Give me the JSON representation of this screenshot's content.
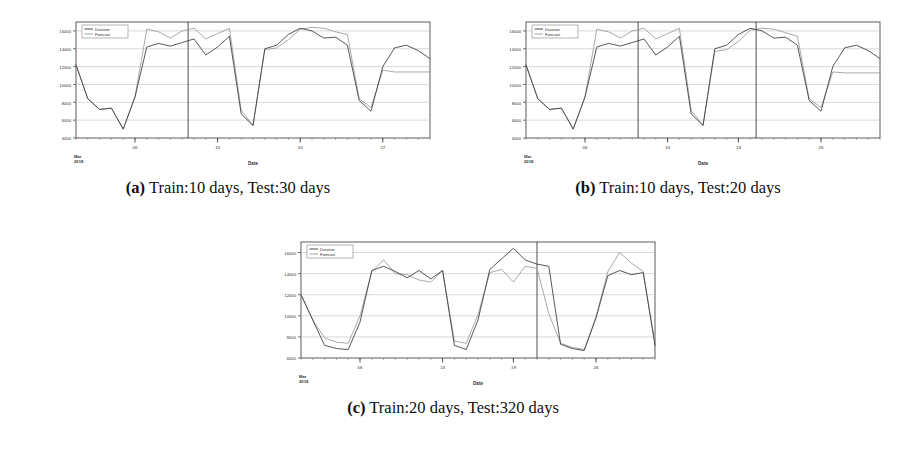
{
  "figure": {
    "panels": [
      {
        "id": "a",
        "letter": "(a)",
        "caption": "Train:10 days, Test:30 days",
        "chart_data": {
          "type": "line",
          "title": "",
          "xlabel": "Date",
          "ylabel": "",
          "origin_label": "Mar\n2018",
          "grid": true,
          "legend_position": "top-left",
          "ylim": [
            4000,
            17000
          ],
          "yticks": [
            4000,
            6000,
            8000,
            10000,
            12000,
            14000,
            16000
          ],
          "ytick_labels": [
            "4000",
            "6000",
            "8000",
            "10000",
            "12000",
            "14000",
            "16000"
          ],
          "xticks": [
            6,
            13,
            20,
            27
          ],
          "xtick_labels": [
            "06",
            "13",
            "20",
            "27"
          ],
          "xlim": [
            1,
            31
          ],
          "split_lines": [
            10.5
          ],
          "series": [
            {
              "name": "Duration",
              "color": "#3a3a3a",
              "x": [
                1,
                2,
                3,
                4,
                5,
                6,
                7,
                8,
                9,
                10,
                11,
                12,
                13,
                14,
                15,
                16,
                17,
                18,
                19,
                20,
                21,
                22,
                23,
                24,
                25,
                26,
                27,
                28,
                29,
                30,
                31
              ],
              "values": [
                12200,
                8400,
                7200,
                7350,
                5000,
                8600,
                14200,
                14600,
                14300,
                14700,
                15100,
                13300,
                14200,
                15400,
                6700,
                5400,
                14000,
                14400,
                15600,
                16300,
                16000,
                15200,
                15300,
                14400,
                8200,
                7000,
                12000,
                14100,
                14400,
                13800,
                12900
              ]
            },
            {
              "name": "Forecast",
              "color": "#9a9a9a",
              "x": [
                1,
                2,
                3,
                4,
                5,
                6,
                7,
                8,
                9,
                10,
                11,
                12,
                13,
                14,
                15,
                16,
                17,
                18,
                19,
                20,
                21,
                22,
                23,
                24,
                25,
                26,
                27,
                28,
                29,
                30,
                31
              ],
              "values": [
                12200,
                8400,
                7200,
                7350,
                5000,
                8600,
                16200,
                15900,
                15200,
                16000,
                16300,
                15100,
                15700,
                16300,
                7100,
                5400,
                13900,
                14100,
                15000,
                16200,
                16400,
                16300,
                15900,
                15600,
                8400,
                7400,
                11600,
                11400,
                11400,
                11400,
                11400
              ]
            }
          ]
        }
      },
      {
        "id": "b",
        "letter": "(b)",
        "caption": "Train:10 days, Test:20 days",
        "chart_data": {
          "type": "line",
          "title": "",
          "xlabel": "Date",
          "ylabel": "",
          "origin_label": "Mar\n2018",
          "grid": true,
          "legend_position": "top-left",
          "ylim": [
            4000,
            17000
          ],
          "yticks": [
            4000,
            6000,
            8000,
            10000,
            12000,
            14000,
            16000
          ],
          "ytick_labels": [
            "4000",
            "6000",
            "8000",
            "10000",
            "12000",
            "14000",
            "16000"
          ],
          "xticks": [
            6,
            13,
            19,
            26
          ],
          "xtick_labels": [
            "06",
            "13",
            "19",
            "26"
          ],
          "xlim": [
            1,
            31
          ],
          "split_lines": [
            10.5,
            20.5
          ],
          "series": [
            {
              "name": "Duration",
              "color": "#3a3a3a",
              "x": [
                1,
                2,
                3,
                4,
                5,
                6,
                7,
                8,
                9,
                10,
                11,
                12,
                13,
                14,
                15,
                16,
                17,
                18,
                19,
                20,
                21,
                22,
                23,
                24,
                25,
                26,
                27,
                28,
                29,
                30,
                31
              ],
              "values": [
                12200,
                8400,
                7200,
                7350,
                5000,
                8600,
                14200,
                14600,
                14300,
                14700,
                15100,
                13300,
                14200,
                15400,
                6700,
                5400,
                14000,
                14400,
                15600,
                16300,
                16000,
                15200,
                15300,
                14400,
                8200,
                7000,
                12000,
                14100,
                14400,
                13800,
                12900
              ]
            },
            {
              "name": "Forecast",
              "color": "#9a9a9a",
              "x": [
                1,
                2,
                3,
                4,
                5,
                6,
                7,
                8,
                9,
                10,
                11,
                12,
                13,
                14,
                15,
                16,
                17,
                18,
                19,
                20,
                21,
                22,
                23,
                24,
                25,
                26,
                27,
                28,
                29,
                30,
                31
              ],
              "values": [
                12200,
                8400,
                7200,
                7350,
                5000,
                8600,
                16200,
                15900,
                15200,
                16000,
                16300,
                15100,
                15700,
                16300,
                7100,
                5400,
                13700,
                13900,
                14800,
                16100,
                16300,
                16200,
                15800,
                15400,
                8400,
                7400,
                11400,
                11300,
                11300,
                11300,
                11300
              ]
            }
          ]
        }
      },
      {
        "id": "c",
        "letter": "(c)",
        "caption": "Train:20 days, Test:320 days",
        "chart_data": {
          "type": "line",
          "title": "",
          "xlabel": "Date",
          "ylabel": "",
          "origin_label": "Mar\n2018",
          "grid": true,
          "legend_position": "top-left",
          "ylim": [
            6000,
            17000
          ],
          "yticks": [
            6000,
            8000,
            10000,
            12000,
            14000,
            16000
          ],
          "ytick_labels": [
            "6000",
            "8000",
            "10000",
            "12000",
            "14000",
            "16000"
          ],
          "xticks": [
            6,
            13,
            19,
            26
          ],
          "xtick_labels": [
            "06",
            "13",
            "19",
            "26"
          ],
          "xlim": [
            1,
            31
          ],
          "split_lines": [
            21.0
          ],
          "series": [
            {
              "name": "Duration",
              "color": "#3a3a3a",
              "x": [
                1,
                2,
                3,
                4,
                5,
                6,
                7,
                8,
                9,
                10,
                11,
                12,
                13,
                14,
                15,
                16,
                17,
                18,
                19,
                20,
                21,
                22,
                23,
                24,
                25,
                26,
                27,
                28,
                29,
                30,
                31
              ],
              "values": [
                12000,
                9600,
                7200,
                6900,
                6800,
                9400,
                14300,
                14700,
                14200,
                13600,
                14300,
                13500,
                14300,
                7200,
                6800,
                9600,
                14400,
                15400,
                16400,
                15300,
                14900,
                14700,
                7300,
                6900,
                6700,
                9800,
                13800,
                14300,
                13900,
                14100,
                7200
              ]
            },
            {
              "name": "Forecast",
              "color": "#9a9a9a",
              "x": [
                1,
                2,
                3,
                4,
                5,
                6,
                7,
                8,
                9,
                10,
                11,
                12,
                13,
                14,
                15,
                16,
                17,
                18,
                19,
                20,
                21,
                22,
                23,
                24,
                25,
                26,
                27,
                28,
                29,
                30,
                31
              ],
              "values": [
                12000,
                9600,
                7900,
                7500,
                7400,
                10000,
                14200,
                15300,
                14000,
                13900,
                13400,
                13200,
                14300,
                7600,
                7400,
                10100,
                14100,
                14400,
                13200,
                14700,
                14500,
                10200,
                7400,
                7000,
                6800,
                9900,
                14200,
                16000,
                15000,
                14200,
                7400
              ]
            }
          ]
        }
      }
    ]
  }
}
